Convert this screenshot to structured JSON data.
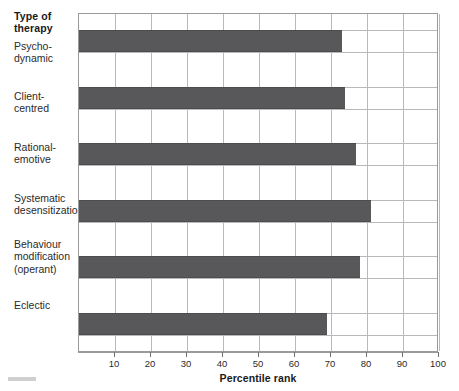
{
  "chart_data": {
    "type": "bar",
    "orientation": "horizontal",
    "title": "",
    "xlabel": "Percentile rank",
    "ylabel": "Type of\ntherapy",
    "categories": [
      "Psycho-\ndynamic",
      "Client-\ncentred",
      "Rational-\nemotive",
      "Systematic\ndesensitization",
      "Behaviour\nmodification\n(operant)",
      "Eclectic"
    ],
    "values": [
      73,
      74,
      77,
      81,
      78,
      69
    ],
    "xlim": [
      0,
      100
    ],
    "xticks": [
      10,
      20,
      30,
      40,
      50,
      60,
      70,
      80,
      90,
      100
    ],
    "xtick_labels": [
      "10",
      "20",
      "30",
      "40",
      "50",
      "60",
      "70",
      "80",
      "90",
      "100"
    ],
    "grid": {
      "vertical": true,
      "horizontal": true,
      "vertical_color": "#b9b9b9",
      "horizontal_color": "#b9b9b9"
    },
    "legend": null,
    "bar_color": "#58585a",
    "plot_border_color": "#9a9a9a",
    "background_color": "#ffffff"
  }
}
